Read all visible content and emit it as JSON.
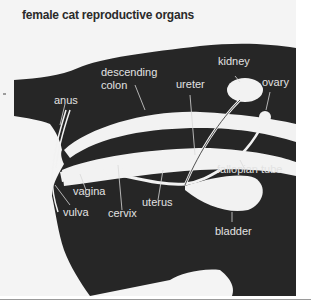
{
  "title": "female cat reproductive organs",
  "labels": {
    "descending_colon_line1": "descending",
    "descending_colon_line2": "colon",
    "kidney": "kidney",
    "ureter": "ureter",
    "ovary": "ovary",
    "anus": "anus",
    "fallopian_tube": "fallopian tube",
    "vagina": "vagina",
    "uterus": "uterus",
    "vulva": "vulva",
    "cervix": "cervix",
    "bladder": "bladder"
  },
  "colors": {
    "body": "#262626",
    "organ": "#f2f2f2",
    "label": "#e2e2e2",
    "background": "#f4f4f4"
  }
}
